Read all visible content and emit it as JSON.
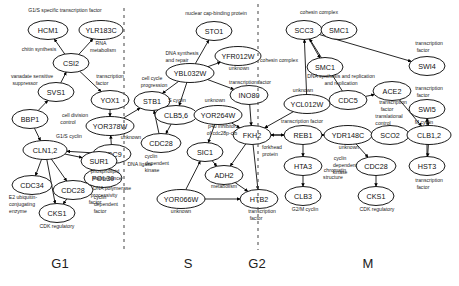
{
  "figure": {
    "background_color": "#ffffff",
    "node_fill": "#ffffff",
    "node_stroke": "#000000",
    "edge_color": "#000000",
    "divider_color": "#555555"
  },
  "phases": [
    {
      "id": "g1",
      "label": "G1",
      "x": 60,
      "y": 268
    },
    {
      "id": "s",
      "label": "S",
      "x": 188,
      "y": 268
    },
    {
      "id": "g2",
      "label": "G2",
      "x": 257,
      "y": 268
    },
    {
      "id": "m",
      "label": "M",
      "x": 368,
      "y": 268
    }
  ],
  "dividers": [
    {
      "id": "divider-g1-s",
      "x": 124,
      "y1": 8,
      "y2": 250
    },
    {
      "id": "divider-s-g2",
      "x": 258,
      "y1": 4,
      "y2": 250
    }
  ],
  "nodes": [
    {
      "id": "hcm1",
      "label": "HCM1",
      "cx": 48,
      "cy": 30,
      "rx": 20,
      "ry": 9.5
    },
    {
      "id": "ylr183c",
      "label": "YLR183C",
      "cx": 101,
      "cy": 30,
      "rx": 22,
      "ry": 9.5
    },
    {
      "id": "csi2",
      "label": "CSI2",
      "cx": 71,
      "cy": 63,
      "rx": 18,
      "ry": 9.5
    },
    {
      "id": "svs1",
      "label": "SVS1",
      "cx": 56,
      "cy": 92,
      "rx": 18,
      "ry": 9.5
    },
    {
      "id": "bbp1",
      "label": "BBP1",
      "cx": 30,
      "cy": 119,
      "rx": 18,
      "ry": 9.5
    },
    {
      "id": "cln12",
      "label": "CLN1,2",
      "cx": 45,
      "cy": 150,
      "rx": 22,
      "ry": 9.5
    },
    {
      "id": "cdc34",
      "label": "CDC34",
      "cx": 32,
      "cy": 185,
      "rx": 20,
      "ry": 9.5
    },
    {
      "id": "cdc28_g1",
      "label": "CDC28",
      "cx": 73,
      "cy": 190,
      "rx": 20,
      "ry": 9.5
    },
    {
      "id": "cks1_g1",
      "label": "CKS1",
      "cx": 57,
      "cy": 213,
      "rx": 18,
      "ry": 9.5
    },
    {
      "id": "yox1",
      "label": "YOX1",
      "cx": 110,
      "cy": 100,
      "rx": 19,
      "ry": 9.5
    },
    {
      "id": "yor378w",
      "label": "YOR378W",
      "cx": 110,
      "cy": 126,
      "rx": 24,
      "ry": 9.5
    },
    {
      "id": "cdc9",
      "label": "CDC9",
      "cx": 112,
      "cy": 154,
      "rx": 19,
      "ry": 9.5
    },
    {
      "id": "pol30",
      "label": "POL30",
      "cx": 103,
      "cy": 178,
      "rx": 19,
      "ry": 9.5
    },
    {
      "id": "sur1",
      "label": "SUR1",
      "cx": 99,
      "cy": 161,
      "rx": 18,
      "ry": 9.5
    },
    {
      "id": "sto1",
      "label": "STO1",
      "cx": 214,
      "cy": 31,
      "rx": 18,
      "ry": 9.5
    },
    {
      "id": "ybl032w",
      "label": "YBL032W",
      "cx": 190,
      "cy": 73,
      "rx": 24,
      "ry": 9.5
    },
    {
      "id": "yfr012w",
      "label": "YFR012W",
      "cx": 238,
      "cy": 56,
      "rx": 23,
      "ry": 9.5
    },
    {
      "id": "ino80",
      "label": "INO80",
      "cx": 249,
      "cy": 95,
      "rx": 19,
      "ry": 9.5
    },
    {
      "id": "stb1",
      "label": "STB1",
      "cx": 152,
      "cy": 101,
      "rx": 18,
      "ry": 9.5
    },
    {
      "id": "clb56",
      "label": "CLB5,6",
      "cx": 176,
      "cy": 115,
      "rx": 21,
      "ry": 9.5
    },
    {
      "id": "yor264w",
      "label": "YOR264W",
      "cx": 218,
      "cy": 115,
      "rx": 24,
      "ry": 9.5
    },
    {
      "id": "cdc28_s",
      "label": "CDC28",
      "cx": 161,
      "cy": 143,
      "rx": 20,
      "ry": 9.5
    },
    {
      "id": "sic1",
      "label": "SIC1",
      "cx": 205,
      "cy": 152,
      "rx": 18,
      "ry": 9.5
    },
    {
      "id": "adh2",
      "label": "ADH2",
      "cx": 224,
      "cy": 175,
      "rx": 19,
      "ry": 9.5
    },
    {
      "id": "yor066w",
      "label": "YOR066W",
      "cx": 181,
      "cy": 199,
      "rx": 24,
      "ry": 9.5
    },
    {
      "id": "fkh2",
      "label": "FKH2",
      "cx": 252,
      "cy": 135,
      "rx": 19,
      "ry": 9.5
    },
    {
      "id": "htb2",
      "label": "HTB2",
      "cx": 259,
      "cy": 199,
      "rx": 19,
      "ry": 9.5
    },
    {
      "id": "scc3",
      "label": "SCC3",
      "cx": 304,
      "cy": 30,
      "rx": 18,
      "ry": 9.5
    },
    {
      "id": "smc1_top",
      "label": "SMC1",
      "cx": 339,
      "cy": 30,
      "rx": 18,
      "ry": 9.5
    },
    {
      "id": "smc1",
      "label": "SMC1",
      "cx": 325,
      "cy": 67,
      "rx": 18,
      "ry": 9.5
    },
    {
      "id": "ycl012w",
      "label": "YCL012W",
      "cx": 307,
      "cy": 104,
      "rx": 23,
      "ry": 9.5
    },
    {
      "id": "cdc5",
      "label": "CDC5",
      "cx": 348,
      "cy": 100,
      "rx": 19,
      "ry": 9.5
    },
    {
      "id": "ace2",
      "label": "ACE2",
      "cx": 392,
      "cy": 91,
      "rx": 19,
      "ry": 9.5
    },
    {
      "id": "swi4",
      "label": "SWI4",
      "cx": 427,
      "cy": 66,
      "rx": 18,
      "ry": 9.5
    },
    {
      "id": "swi5",
      "label": "SWI5",
      "cx": 427,
      "cy": 109,
      "rx": 18,
      "ry": 9.5
    },
    {
      "id": "reb1",
      "label": "REB1",
      "cx": 303,
      "cy": 135,
      "rx": 19,
      "ry": 9.5
    },
    {
      "id": "ydr148c",
      "label": "YDR148C",
      "cx": 348,
      "cy": 135,
      "rx": 24,
      "ry": 9.5
    },
    {
      "id": "sco2",
      "label": "SCO2",
      "cx": 390,
      "cy": 135,
      "rx": 19,
      "ry": 9.5
    },
    {
      "id": "clb12",
      "label": "CLB1,2",
      "cx": 429,
      "cy": 135,
      "rx": 22,
      "ry": 9.5
    },
    {
      "id": "hta3",
      "label": "HTA3",
      "cx": 303,
      "cy": 166,
      "rx": 19,
      "ry": 9.5
    },
    {
      "id": "cdc28_m",
      "label": "CDC28",
      "cx": 376,
      "cy": 166,
      "rx": 20,
      "ry": 9.5
    },
    {
      "id": "clb3",
      "label": "CLB3",
      "cx": 303,
      "cy": 196,
      "rx": 18,
      "ry": 9.5
    },
    {
      "id": "cks1_m",
      "label": "CKS1",
      "cx": 376,
      "cy": 196,
      "rx": 18,
      "ry": 9.5
    },
    {
      "id": "hst3",
      "label": "HST3",
      "cx": 427,
      "cy": 166,
      "rx": 18,
      "ry": 9.5
    }
  ],
  "annotations": [
    {
      "id": "ann-g1s-tf",
      "text": "G1/S specific transcription factor",
      "x": 65,
      "y": 12,
      "anchor": "middle"
    },
    {
      "id": "ann-rna-metab-1",
      "text": "RNA",
      "x": 101,
      "y": 45,
      "anchor": "middle"
    },
    {
      "id": "ann-rna-metab-2",
      "text": "metabolism",
      "x": 103,
      "y": 52,
      "anchor": "middle"
    },
    {
      "id": "ann-chitin",
      "text": "chitin synthesis",
      "x": 39,
      "y": 51,
      "anchor": "middle"
    },
    {
      "id": "ann-vanadate-1",
      "text": "vanadate sensitive",
      "x": 32,
      "y": 78,
      "anchor": "middle"
    },
    {
      "id": "ann-vanadate-2",
      "text": "suppressor",
      "x": 25,
      "y": 85,
      "anchor": "middle"
    },
    {
      "id": "ann-celldiv-1",
      "text": "cell division",
      "x": 75,
      "y": 117,
      "anchor": "middle"
    },
    {
      "id": "ann-celldiv-2",
      "text": "control",
      "x": 68,
      "y": 124,
      "anchor": "middle"
    },
    {
      "id": "ann-g1s-cyclin",
      "text": "G1/S cyclin",
      "x": 69,
      "y": 138,
      "anchor": "middle"
    },
    {
      "id": "ann-e2ub-1",
      "text": "E2 ubiquitin-",
      "x": 23,
      "y": 199,
      "anchor": "middle"
    },
    {
      "id": "ann-e2ub-2",
      "text": "conjugating",
      "x": 22,
      "y": 206,
      "anchor": "middle"
    },
    {
      "id": "ann-e2ub-3",
      "text": "enzyme",
      "x": 18,
      "y": 213,
      "anchor": "middle"
    },
    {
      "id": "ann-cyc-dep-1",
      "text": "cyclin",
      "x": 100,
      "y": 199,
      "anchor": "middle"
    },
    {
      "id": "ann-cyc-dep-2",
      "text": "dependent",
      "x": 106,
      "y": 206,
      "anchor": "middle"
    },
    {
      "id": "ann-cyc-dep-3",
      "text": "factor",
      "x": 100,
      "y": 213,
      "anchor": "middle"
    },
    {
      "id": "ann-cdk-reg-g1",
      "text": "CDK regulatory",
      "x": 57,
      "y": 228,
      "anchor": "middle"
    },
    {
      "id": "ann-tf-yox1-1",
      "text": "transcription",
      "x": 110,
      "y": 78,
      "anchor": "middle"
    },
    {
      "id": "ann-tf-yox1-2",
      "text": "factor",
      "x": 102,
      "y": 85,
      "anchor": "middle"
    },
    {
      "id": "ann-unknown-yor378",
      "text": "unknown",
      "x": 131,
      "y": 139,
      "anchor": "middle"
    },
    {
      "id": "ann-dna-ligase",
      "text": "DNA ligase",
      "x": 140,
      "y": 166,
      "anchor": "middle"
    },
    {
      "id": "ann-phospholipid-1",
      "text": "phospholipid",
      "x": 105,
      "y": 173,
      "anchor": "middle"
    },
    {
      "id": "ann-phospholipid-2",
      "text": "maintenance",
      "x": 107,
      "y": 180,
      "anchor": "middle"
    },
    {
      "id": "ann-dnapol-1",
      "text": "DNA polymerase",
      "x": 112,
      "y": 190,
      "anchor": "middle"
    },
    {
      "id": "ann-dnapol-2",
      "text": "processivity",
      "x": 104,
      "y": 197,
      "anchor": "middle"
    },
    {
      "id": "ann-dnapol-3",
      "text": "factor",
      "x": 95,
      "y": 204,
      "anchor": "middle"
    },
    {
      "id": "ann-nuclear-cap",
      "text": "nuclear cap-binding protein",
      "x": 216,
      "y": 15,
      "anchor": "middle"
    },
    {
      "id": "ann-dnasynth-1",
      "text": "DNA synthesis",
      "x": 182,
      "y": 55,
      "anchor": "middle"
    },
    {
      "id": "ann-dnasynth-2",
      "text": "and repair",
      "x": 177,
      "y": 62,
      "anchor": "middle"
    },
    {
      "id": "ann-unknown-yfr012",
      "text": "unknown",
      "x": 239,
      "y": 70,
      "anchor": "middle"
    },
    {
      "id": "ann-tf-ino80",
      "text": "transcription factor",
      "x": 250,
      "y": 84,
      "anchor": "middle"
    },
    {
      "id": "ann-ccprog-1",
      "text": "cell cycle",
      "x": 152,
      "y": 80,
      "anchor": "middle"
    },
    {
      "id": "ann-ccprog-2",
      "text": "progression",
      "x": 154,
      "y": 87,
      "anchor": "middle"
    },
    {
      "id": "ann-s-cyclin",
      "text": "S cyclin",
      "x": 177,
      "y": 102,
      "anchor": "middle"
    },
    {
      "id": "ann-unknown-yor264",
      "text": "unknown",
      "x": 215,
      "y": 102,
      "anchor": "middle"
    },
    {
      "id": "ann-p40-1",
      "text": "p40 inhibitor",
      "x": 222,
      "y": 128,
      "anchor": "middle"
    },
    {
      "id": "ann-p40-2",
      "text": "of cdc28p-clb",
      "x": 222,
      "y": 135,
      "anchor": "middle"
    },
    {
      "id": "ann-cyc-dep-s-1",
      "text": "cyclin",
      "x": 151,
      "y": 158,
      "anchor": "middle"
    },
    {
      "id": "ann-cyc-dep-s-2",
      "text": "dependent",
      "x": 157,
      "y": 165,
      "anchor": "middle"
    },
    {
      "id": "ann-cyc-dep-s-3",
      "text": "kinase",
      "x": 152,
      "y": 172,
      "anchor": "middle"
    },
    {
      "id": "ann-metabolism",
      "text": "metabolism",
      "x": 224,
      "y": 188,
      "anchor": "middle"
    },
    {
      "id": "ann-unknown-yor066",
      "text": "unknown",
      "x": 181,
      "y": 213,
      "anchor": "middle"
    },
    {
      "id": "ann-forkhead-1",
      "text": "forkhead",
      "x": 272,
      "y": 149,
      "anchor": "middle"
    },
    {
      "id": "ann-forkhead-2",
      "text": "protein",
      "x": 270,
      "y": 156,
      "anchor": "middle"
    },
    {
      "id": "ann-tf-htb2-1",
      "text": "transcription",
      "x": 262,
      "y": 213,
      "anchor": "middle"
    },
    {
      "id": "ann-tf-htb2-2",
      "text": "factor",
      "x": 256,
      "y": 220,
      "anchor": "middle"
    },
    {
      "id": "ann-cohesin-top",
      "text": "cohesin complex",
      "x": 319,
      "y": 14,
      "anchor": "middle"
    },
    {
      "id": "ann-cohesin-left",
      "text": "cohesin complex",
      "x": 279,
      "y": 62,
      "anchor": "middle"
    },
    {
      "id": "ann-dnarep-1",
      "text": "DNA synthesis and replication",
      "x": 341,
      "y": 78,
      "anchor": "middle"
    },
    {
      "id": "ann-dnarep-2",
      "text": "and replication",
      "x": 341,
      "y": 85,
      "anchor": "middle"
    },
    {
      "id": "ann-unknown-ycl012",
      "text": "unknown",
      "x": 303,
      "y": 92,
      "anchor": "middle"
    },
    {
      "id": "ann-tf-swi4-1",
      "text": "transcription",
      "x": 429,
      "y": 45,
      "anchor": "middle"
    },
    {
      "id": "ann-tf-swi4-2",
      "text": "factor",
      "x": 423,
      "y": 52,
      "anchor": "middle"
    },
    {
      "id": "ann-tf-ace2-1",
      "text": "transcription",
      "x": 393,
      "y": 104,
      "anchor": "middle"
    },
    {
      "id": "ann-tf-ace2-2",
      "text": "factor",
      "x": 387,
      "y": 111,
      "anchor": "middle"
    },
    {
      "id": "ann-tf-swi5-1",
      "text": "transcription",
      "x": 429,
      "y": 90,
      "anchor": "middle"
    },
    {
      "id": "ann-tf-swi5-2",
      "text": "factor",
      "x": 423,
      "y": 97,
      "anchor": "middle"
    },
    {
      "id": "ann-tf-reb1",
      "text": "transcription factor",
      "x": 302,
      "y": 123,
      "anchor": "middle"
    },
    {
      "id": "ann-unknown-ydr148",
      "text": "unknown",
      "x": 349,
      "y": 149,
      "anchor": "middle"
    },
    {
      "id": "ann-transl-1",
      "text": "translational",
      "x": 389,
      "y": 118,
      "anchor": "middle"
    },
    {
      "id": "ann-transl-2",
      "text": "control",
      "x": 383,
      "y": 125,
      "anchor": "middle"
    },
    {
      "id": "ann-m-cyclin",
      "text": "M cyclin",
      "x": 424,
      "y": 124,
      "anchor": "middle"
    },
    {
      "id": "ann-chromatin-1",
      "text": "chromatin",
      "x": 335,
      "y": 172,
      "anchor": "middle"
    },
    {
      "id": "ann-chromatin-2",
      "text": "structure",
      "x": 333,
      "y": 179,
      "anchor": "middle"
    },
    {
      "id": "ann-g2m-cyclin",
      "text": "G2/M cyclin",
      "x": 305,
      "y": 211,
      "anchor": "middle"
    },
    {
      "id": "ann-cyc-dep-m-1",
      "text": "cyclin",
      "x": 340,
      "y": 160,
      "anchor": "middle"
    },
    {
      "id": "ann-cyc-dep-m-2",
      "text": "dependent",
      "x": 345,
      "y": 167,
      "anchor": "middle"
    },
    {
      "id": "ann-cyc-dep-m-3",
      "text": "kinase",
      "x": 340,
      "y": 174,
      "anchor": "middle"
    },
    {
      "id": "ann-tf-hst3-1",
      "text": "transcription",
      "x": 429,
      "y": 182,
      "anchor": "middle"
    },
    {
      "id": "ann-tf-hst3-2",
      "text": "factor",
      "x": 423,
      "y": 189,
      "anchor": "middle"
    },
    {
      "id": "ann-cdk-reg-m",
      "text": "CDK regulatory",
      "x": 377,
      "y": 211,
      "anchor": "middle"
    }
  ],
  "edges": [
    {
      "id": "e-csi2-hcm1",
      "from": "csi2",
      "to": "hcm1"
    },
    {
      "id": "e-csi2-ylr183c",
      "from": "csi2",
      "to": "ylr183c"
    },
    {
      "id": "e-svs1-csi2",
      "from": "svs1",
      "to": "csi2"
    },
    {
      "id": "e-bbp1-svs1",
      "from": "bbp1",
      "to": "svs1"
    },
    {
      "id": "e-csi2-yox1",
      "from": "csi2",
      "to": "yox1"
    },
    {
      "id": "e-bbp1-cln12",
      "from": "bbp1",
      "to": "cln12"
    },
    {
      "id": "e-cln12-cdc34",
      "from": "cln12",
      "to": "cdc34"
    },
    {
      "id": "e-cln12-cdc28g1",
      "from": "cln12",
      "to": "cdc28_g1"
    },
    {
      "id": "e-cln12-cks1g1",
      "from": "cln12",
      "to": "cks1_g1"
    },
    {
      "id": "e-cdc28g1-cks1g1",
      "from": "cdc28_g1",
      "to": "cks1_g1"
    },
    {
      "id": "e-cln12-sur1",
      "from": "cln12",
      "to": "sur1"
    },
    {
      "id": "e-sur1-pol30",
      "from": "sur1",
      "to": "pol30"
    },
    {
      "id": "e-cdc9-cln12",
      "from": "cdc9",
      "to": "cln12"
    },
    {
      "id": "e-cdc9-pol30",
      "from": "cdc9",
      "to": "pol30"
    },
    {
      "id": "e-yox1-yor378w",
      "from": "yox1",
      "to": "yor378w"
    },
    {
      "id": "e-cdc9-yor378w",
      "from": "cdc9",
      "to": "yor378w"
    },
    {
      "id": "e-yor378w-stb1",
      "from": "yor378w",
      "to": "stb1"
    },
    {
      "id": "e-clb56-stb1",
      "from": "clb56",
      "to": "stb1"
    },
    {
      "id": "e-cdc28s-stb1",
      "from": "cdc28_s",
      "to": "stb1"
    },
    {
      "id": "e-ybl032w-sto1",
      "from": "ybl032w",
      "to": "sto1"
    },
    {
      "id": "e-ybl032w-yfr012w",
      "from": "ybl032w",
      "to": "yfr012w"
    },
    {
      "id": "e-ybl032w-ino80",
      "from": "ybl032w",
      "to": "ino80"
    },
    {
      "id": "e-ybl032w-stb1",
      "from": "ybl032w",
      "to": "stb1"
    },
    {
      "id": "e-ybl032w-clb56",
      "from": "ybl032w",
      "to": "clb56"
    },
    {
      "id": "e-clb56-cdc28s",
      "from": "clb56",
      "to": "cdc28_s"
    },
    {
      "id": "e-yor264w-sic1",
      "from": "yor264w",
      "to": "sic1"
    },
    {
      "id": "e-yor264w-fkh2",
      "from": "yor264w",
      "to": "fkh2"
    },
    {
      "id": "e-ino80-fkh2",
      "from": "ino80",
      "to": "fkh2"
    },
    {
      "id": "e-sic1-adh2",
      "from": "sic1",
      "to": "adh2"
    },
    {
      "id": "e-yor066w-sic1",
      "from": "yor066w",
      "to": "sic1"
    },
    {
      "id": "e-yor066w-htb2",
      "from": "yor066w",
      "to": "htb2"
    },
    {
      "id": "e-adh2-htb2",
      "from": "adh2",
      "to": "htb2"
    },
    {
      "id": "e-fkh2-htb2",
      "from": "fkh2",
      "to": "htb2"
    },
    {
      "id": "e-fkh2-adh2",
      "from": "fkh2",
      "to": "adh2"
    },
    {
      "id": "e-scc3-smc1",
      "from": "scc3",
      "to": "smc1"
    },
    {
      "id": "e-scc3-swi4",
      "from": "scc3",
      "to": "swi4"
    },
    {
      "id": "e-cdc5-scc3",
      "from": "cdc5",
      "to": "scc3"
    },
    {
      "id": "e-ycl012w-scc3",
      "from": "ycl012w",
      "to": "scc3"
    },
    {
      "id": "e-ycl012w-cdc5",
      "from": "ycl012w",
      "to": "cdc5"
    },
    {
      "id": "e-cdc5-ace2",
      "from": "cdc5",
      "to": "ace2"
    },
    {
      "id": "e-ace2-clb12",
      "from": "ace2",
      "to": "clb12"
    },
    {
      "id": "e-swi5-clb12",
      "from": "swi5",
      "to": "clb12"
    },
    {
      "id": "e-reb1-ydr148c",
      "from": "reb1",
      "to": "ydr148c"
    },
    {
      "id": "e-ydr148c-sco2",
      "from": "ydr148c",
      "to": "sco2"
    },
    {
      "id": "e-sco2-clb12",
      "from": "sco2",
      "to": "clb12"
    },
    {
      "id": "e-reb1-hta3",
      "from": "reb1",
      "to": "hta3"
    },
    {
      "id": "e-hta3-clb3",
      "from": "hta3",
      "to": "clb3"
    },
    {
      "id": "e-ydr148c-cdc28m",
      "from": "ydr148c",
      "to": "cdc28_m"
    },
    {
      "id": "e-cdc28m-cks1m",
      "from": "cdc28_m",
      "to": "cks1_m"
    },
    {
      "id": "e-clb12-hst3",
      "from": "clb12",
      "to": "hst3"
    },
    {
      "id": "e-hst3-swi5",
      "from": "hst3",
      "to": "swi5"
    },
    {
      "id": "e-fkh2-reb1",
      "from": "fkh2",
      "to": "reb1"
    },
    {
      "id": "e-ycl012w-fkh2",
      "from": "ycl012w",
      "to": "fkh2"
    },
    {
      "id": "e-ydr148c-fkh2",
      "from": "ydr148c",
      "to": "fkh2"
    }
  ]
}
